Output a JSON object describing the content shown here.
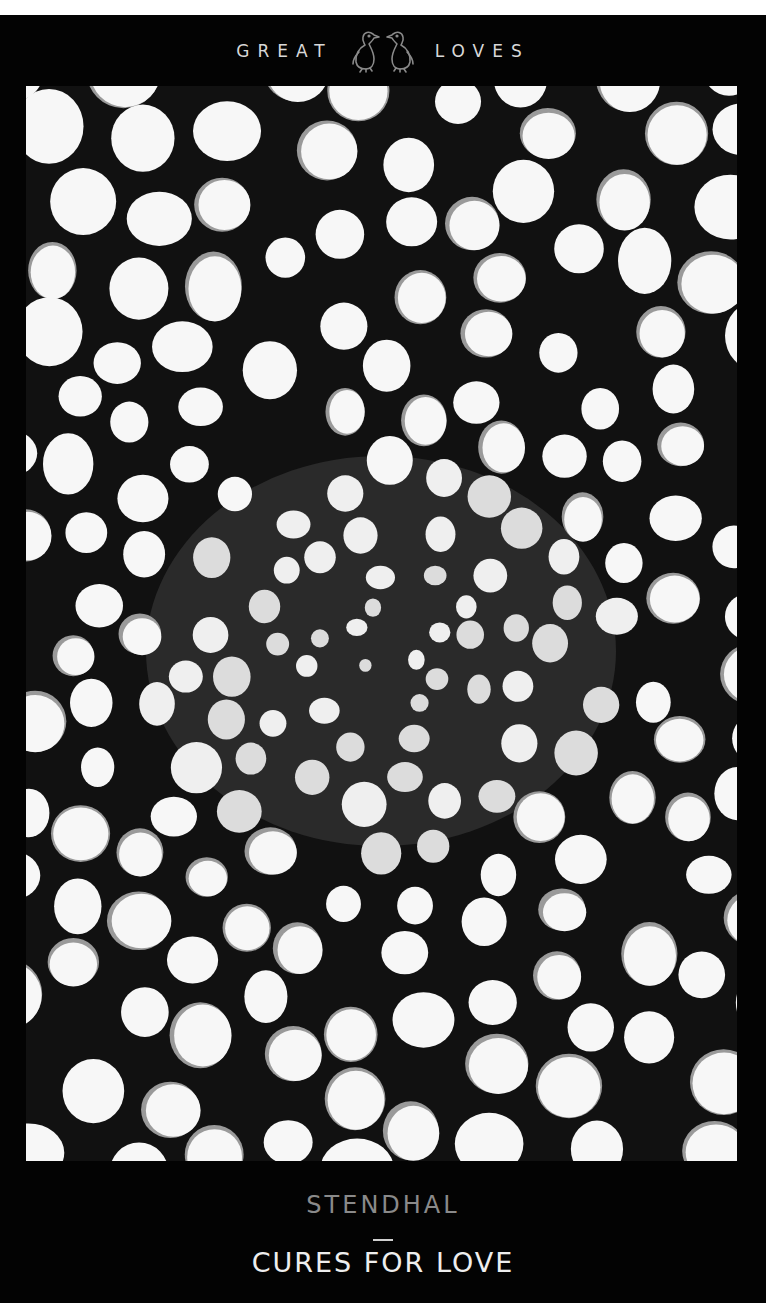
{
  "series": {
    "left_word": "GREAT",
    "right_word": "LOVES",
    "logo_icon": "twin-penguins-logo-icon"
  },
  "book": {
    "author": "STENDHAL",
    "separator": "—",
    "title": "CURES FOR LOVE"
  },
  "artwork": {
    "description": "Micrograph-style illustration of plant cells, dense dark cluster at center",
    "palette": {
      "background": "#030303",
      "cell_fill": "#f7f7f7",
      "cell_wall": "#111111",
      "cell_shade": "#9a9a9a",
      "center_mass": "#2a2a2a"
    }
  },
  "colors": {
    "series_text": "#d8d8d8",
    "logo": "#8a8a8a",
    "author_text": "#8a8a8a",
    "title_text": "#eeeeee"
  }
}
